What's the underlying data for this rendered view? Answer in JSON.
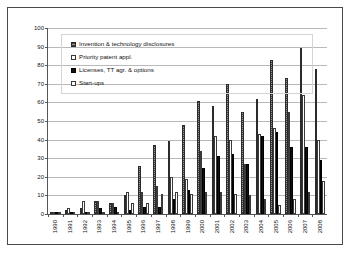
{
  "chart_data": {
    "type": "bar",
    "title": "",
    "xlabel": "",
    "ylabel": "",
    "ylim": [
      0,
      100
    ],
    "ytick_step": 10,
    "yticks": [
      0,
      10,
      20,
      30,
      40,
      50,
      60,
      70,
      80,
      90,
      100
    ],
    "grid": true,
    "legend_position": "top-left",
    "categories": [
      "1990",
      "1991",
      "1992",
      "1993",
      "1994",
      "1995",
      "1996",
      "1997",
      "1998",
      "1999",
      "2000",
      "2001",
      "2002",
      "2003",
      "2004",
      "2005",
      "2006",
      "2007",
      "2008"
    ],
    "series": [
      {
        "name": "Invention & technology disclosures",
        "style": "hatched-grey",
        "color": "#5a5a5a",
        "values": [
          1,
          2,
          3,
          7,
          6,
          10,
          26,
          37,
          39,
          48,
          61,
          58,
          70,
          55,
          62,
          83,
          73,
          89,
          78
        ]
      },
      {
        "name": "Priority patent appl.",
        "style": "white-outline",
        "color": "#ffffff",
        "values": [
          0,
          3,
          7,
          7,
          6,
          12,
          12,
          15,
          20,
          19,
          34,
          42,
          40,
          27,
          43,
          46,
          55,
          64,
          40
        ]
      },
      {
        "name": "Licenses, TT agr. & options",
        "style": "solid-black",
        "color": "#111111",
        "values": [
          0,
          1,
          1,
          3,
          4,
          2,
          4,
          4,
          8,
          13,
          25,
          31,
          32,
          27,
          42,
          44,
          36,
          36,
          29
        ]
      },
      {
        "name": "Start-ups",
        "style": "white-outline",
        "color": "#fbfbfb",
        "values": [
          0,
          1,
          1,
          1,
          1,
          6,
          6,
          11,
          12,
          11,
          12,
          12,
          11,
          10,
          8,
          5,
          8,
          12,
          18
        ]
      }
    ]
  },
  "legend": {
    "items": [
      {
        "label": "Invention & technology disclosures"
      },
      {
        "label": "Priority patent appl."
      },
      {
        "label": "Licenses, TT agr.  & options"
      },
      {
        "label": "Start-ups"
      }
    ]
  }
}
